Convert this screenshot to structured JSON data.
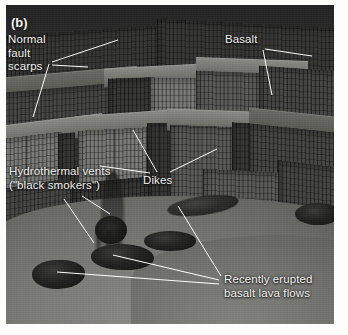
{
  "figure": {
    "panel_letter": "(b)",
    "caption_subject": "mid-ocean-ridge-seafloor-block-diagram",
    "frame": {
      "width": 328,
      "height": 319,
      "background_color": "#4f4f4f"
    }
  },
  "annotations": [
    {
      "key": "normal-fault-scarps",
      "lines": [
        "Normal",
        "fault",
        "scarps"
      ],
      "text": "Normal\nfault\nscarps",
      "x": 8,
      "y": 33,
      "color": "#f2f2ef"
    },
    {
      "key": "basalt",
      "lines": [
        "Basalt"
      ],
      "text": "Basalt",
      "x": 225,
      "y": 33,
      "color": "#f2f2ef"
    },
    {
      "key": "hydrothermal-vents",
      "lines": [
        "Hydrothermal vents",
        "(\"black smokers\")"
      ],
      "text": "Hydrothermal vents\n(\"black smokers\")",
      "x": 9,
      "y": 165,
      "color": "#f2f2ef"
    },
    {
      "key": "dikes",
      "lines": [
        "Dikes"
      ],
      "text": "Dikes",
      "x": 143,
      "y": 174,
      "color": "#f2f2ef"
    },
    {
      "key": "recently-erupted-basalt-lava-flows",
      "lines": [
        "Recently erupted",
        "basalt lava flows"
      ],
      "text": "Recently erupted\nbasalt lava flows",
      "x": 224,
      "y": 273,
      "color": "#f2f2ef"
    }
  ],
  "leader_lines": {
    "color": "#ffffff",
    "width": 1,
    "paths": [
      {
        "key": "scarps-to-upper-ridge",
        "from": [
          52,
          62
        ],
        "to": [
          118,
          40
        ]
      },
      {
        "key": "scarps-to-mid-cliff",
        "from": [
          52,
          65
        ],
        "to": [
          88,
          67
        ]
      },
      {
        "key": "scarps-to-lower-cliff",
        "from": [
          49,
          64
        ],
        "to": [
          33,
          117
        ]
      },
      {
        "key": "basalt-to-column-face",
        "from": [
          263,
          50
        ],
        "to": [
          272,
          95
        ]
      },
      {
        "key": "basalt-to-right-ledge",
        "from": [
          265,
          49
        ],
        "to": [
          312,
          56
        ]
      },
      {
        "key": "dikes-to-left-dike",
        "from": [
          157,
          172
        ],
        "to": [
          133,
          130
        ]
      },
      {
        "key": "dikes-to-right-dike",
        "from": [
          170,
          172
        ],
        "to": [
          217,
          149
        ]
      },
      {
        "key": "dikes-to-far-left-dike",
        "from": [
          150,
          173
        ],
        "to": [
          100,
          166
        ]
      },
      {
        "key": "vents-to-plume-upper",
        "from": [
          82,
          196
        ],
        "to": [
          110,
          214
        ]
      },
      {
        "key": "vents-to-plume-lower",
        "from": [
          64,
          199
        ],
        "to": [
          94,
          243
        ]
      },
      {
        "key": "lava-to-blob-left",
        "from": [
          219,
          284
        ],
        "to": [
          57,
          272
        ]
      },
      {
        "key": "lava-to-blob-mid",
        "from": [
          219,
          280
        ],
        "to": [
          113,
          255
        ]
      },
      {
        "key": "lava-to-dark-flow-upper",
        "from": [
          221,
          276
        ],
        "to": [
          178,
          206
        ]
      }
    ]
  },
  "scene_features": {
    "fault_blocks_label": "stepped normal-fault blocks with columnar basalt faces",
    "sediment_plain_label": "smooth sediment-covered abyssal floor",
    "dark_flows_label": "dark recently erupted pillow-lava blobs",
    "smoker_plumes_label": "black smoker vent plumes"
  }
}
